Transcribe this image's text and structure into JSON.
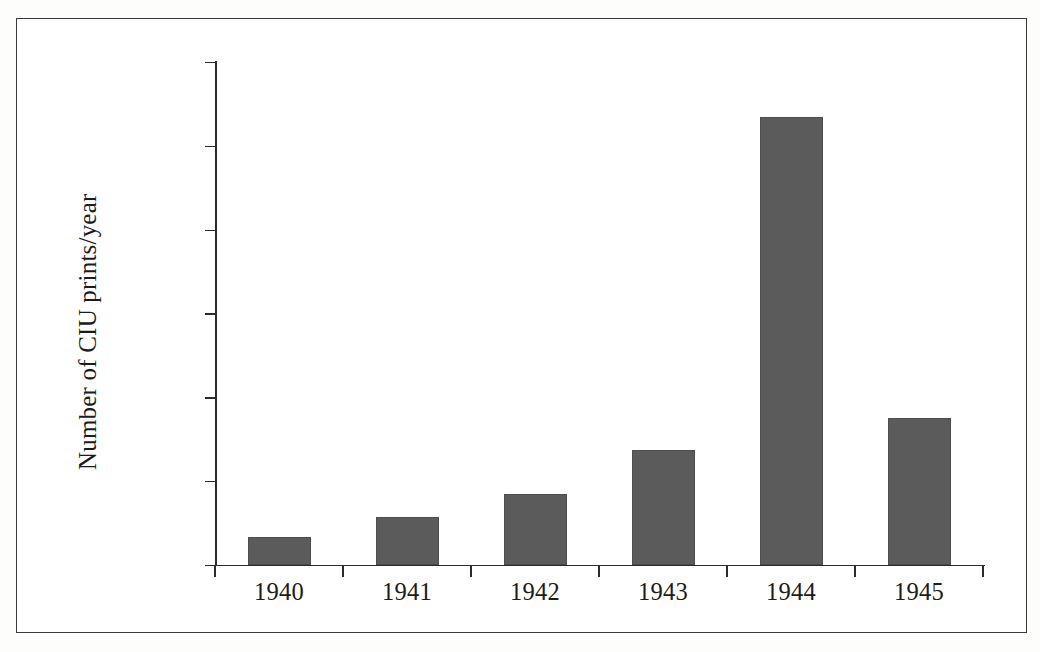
{
  "figure": {
    "background_color": "#ffffff",
    "border_color": "#3a3a3a",
    "bar_color": "#5b5b5b",
    "axis_color": "#2b2b2b"
  },
  "chart_data": {
    "type": "bar",
    "title": "",
    "xlabel": "",
    "ylabel": "Number of CIU prints/year",
    "categories": [
      "1940",
      "1941",
      "1942",
      "1943",
      "1944",
      "1945"
    ],
    "values": [
      17300,
      28700,
      42400,
      68700,
      267500,
      87800
    ],
    "ylim": [
      0,
      300000
    ],
    "yticks": [
      0,
      50000,
      100000,
      150000,
      200000,
      250000,
      300000
    ],
    "ytick_labels": [
      "0",
      "50000",
      "100000",
      "150000",
      "200000",
      "250000",
      "300000"
    ],
    "grid": false,
    "legend": null,
    "series": [
      {
        "name": "CIU prints per year",
        "values": [
          17300,
          28700,
          42400,
          68700,
          267500,
          87800
        ],
        "color": "#5b5b5b"
      }
    ]
  }
}
